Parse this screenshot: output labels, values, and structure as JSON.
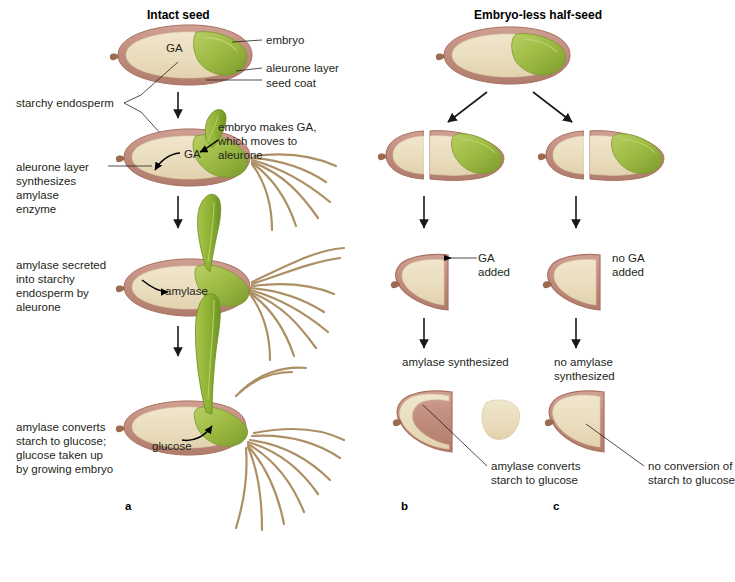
{
  "figure": {
    "titles": {
      "left": "Intact seed",
      "right": "Embryo-less half-seed"
    },
    "panel_letters": {
      "a": "a",
      "b": "b",
      "c": "c"
    },
    "colors": {
      "endosperm": "#EADDBE",
      "seed_coat": "#C49184",
      "seed_coat_dark": "#A9705F",
      "aleurone": "#E0C39C",
      "embryo_green": "#93B13C",
      "embryo_green_light": "#B3C95F",
      "shoot_green": "#8CB233",
      "root_brown": "#A98A5C",
      "text": "#231f20",
      "background": "#FFFFFF"
    },
    "left_column": {
      "stage1_labels": {
        "ga": "GA",
        "embryo": "embryo",
        "aleurone_layer": "aleurone layer",
        "seed_coat": "seed coat"
      },
      "stage2_labels": {
        "ga": "GA",
        "embryo_makes_ga": "embryo makes GA,\nwhich moves to\naleurone"
      },
      "stage3_labels": {
        "amylase": "amylase"
      },
      "stage4_labels": {
        "glucose": "glucose"
      },
      "side_labels": {
        "starchy_endosperm": "starchy endosperm",
        "aleurone_synthesizes": "aleurone layer\nsynthesizes\namylase\nenzyme",
        "amylase_secreted": "amylase secreted\ninto starchy\nendosperm by\naleurone",
        "amylase_converts": "amylase converts\nstarch to glucose;\nglucose taken up\nby growing embryo"
      }
    },
    "right_column": {
      "b_branch": {
        "ga_added": "GA\nadded",
        "amylase_synthesized": "amylase synthesized",
        "amylase_converts": "amylase converts\nstarch to glucose"
      },
      "c_branch": {
        "no_ga_added": "no GA\nadded",
        "no_amylase_synthesized": "no amylase\nsynthesized",
        "no_conversion": "no conversion of\nstarch to glucose"
      }
    }
  }
}
